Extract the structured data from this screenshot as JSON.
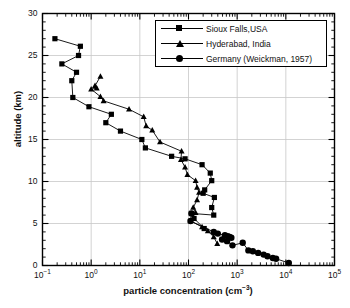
{
  "chart_data": {
    "type": "line",
    "title": "",
    "xlabel": "particle concentration (cm⁻³)",
    "ylabel": "altitude (km)",
    "xscale": "log",
    "yscale": "linear",
    "xlim": [
      0.1,
      100000
    ],
    "ylim": [
      0,
      30
    ],
    "grid": true,
    "legend_position": "top-right",
    "xtick_labels": [
      "10",
      "10",
      "10",
      "10",
      "10",
      "10",
      "10"
    ],
    "xtick_exponents": [
      "-1",
      "0",
      "1",
      "2",
      "3",
      "4",
      "5"
    ],
    "xtick_values": [
      0.1,
      1,
      10,
      100,
      1000,
      10000,
      100000
    ],
    "ytick_labels": [
      "0",
      "5",
      "10",
      "15",
      "20",
      "25",
      "30"
    ],
    "ytick_values": [
      0,
      5,
      10,
      15,
      20,
      25,
      30
    ],
    "series": [
      {
        "name": "Sioux Falls,USA",
        "marker": "square",
        "color": "#000000",
        "points": [
          [
            0.18,
            27.0
          ],
          [
            0.6,
            26.1
          ],
          [
            0.55,
            25.0
          ],
          [
            0.25,
            24.0
          ],
          [
            0.5,
            23.0
          ],
          [
            0.4,
            22.0
          ],
          [
            0.42,
            20.0
          ],
          [
            0.9,
            18.9
          ],
          [
            2.6,
            18.0
          ],
          [
            2.0,
            17.0
          ],
          [
            4.0,
            16.0
          ],
          [
            11.0,
            15.0
          ],
          [
            13.0,
            14.0
          ],
          [
            45.0,
            13.0
          ],
          [
            85.0,
            12.7
          ],
          [
            190.0,
            12.0
          ],
          [
            280.0,
            11.0
          ],
          [
            300.0,
            10.1
          ],
          [
            215.0,
            9.0
          ],
          [
            200.0,
            8.6
          ],
          [
            340.0,
            8.1
          ],
          [
            300.0,
            6.9
          ],
          [
            330.0,
            6.0
          ],
          [
            115.0,
            6.2
          ],
          [
            130.0,
            5.6
          ],
          [
            210.0,
            4.4
          ]
        ]
      },
      {
        "name": "Hyderabad, India",
        "marker": "triangle",
        "color": "#000000",
        "points": [
          [
            1.55,
            22.5
          ],
          [
            1.2,
            21.4
          ],
          [
            1.3,
            21.1
          ],
          [
            1.0,
            21.0
          ],
          [
            1.55,
            20.1
          ],
          [
            1.8,
            19.6
          ],
          [
            6.0,
            18.6
          ],
          [
            12.0,
            17.7
          ],
          [
            13.5,
            16.6
          ],
          [
            18.0,
            16.1
          ],
          [
            26.0,
            14.7
          ],
          [
            72.0,
            13.6
          ],
          [
            70.0,
            12.6
          ],
          [
            85.0,
            11.7
          ],
          [
            95.0,
            10.8
          ],
          [
            140.0,
            10.1
          ],
          [
            150.0,
            9.3
          ],
          [
            165.0,
            8.7
          ],
          [
            150.0,
            7.8
          ],
          [
            125.0,
            6.9
          ],
          [
            140.0,
            6.3
          ],
          [
            110.0,
            5.3
          ],
          [
            190.0,
            4.6
          ],
          [
            250.0,
            4.1
          ],
          [
            330.0,
            3.4
          ],
          [
            390.0,
            2.6
          ]
        ]
      },
      {
        "name": "Germany (Weickman, 1957)",
        "marker": "circle",
        "color": "#000000",
        "points": [
          [
            115.0,
            6.2
          ],
          [
            110.0,
            5.3
          ],
          [
            330.0,
            4.0
          ],
          [
            400.0,
            3.8
          ],
          [
            560.0,
            3.6
          ],
          [
            640.0,
            3.5
          ],
          [
            700.0,
            3.4
          ],
          [
            760.0,
            3.3
          ],
          [
            490.0,
            3.1
          ],
          [
            620.0,
            2.9
          ],
          [
            800.0,
            2.4
          ],
          [
            1300.0,
            2.7
          ],
          [
            1700.0,
            1.8
          ],
          [
            2100.0,
            1.7
          ],
          [
            2700.0,
            1.5
          ],
          [
            3500.0,
            1.3
          ],
          [
            4200.0,
            1.1
          ],
          [
            5400.0,
            0.9
          ],
          [
            6300.0,
            0.8
          ],
          [
            11500.0,
            0.3
          ]
        ]
      }
    ]
  },
  "legend": {
    "items": [
      {
        "label": "Sioux Falls,USA",
        "marker": "square"
      },
      {
        "label": "Hyderabad, India",
        "marker": "triangle"
      },
      {
        "label": "Germany (Weickman, 1957)",
        "marker": "circle"
      }
    ]
  },
  "axes": {
    "x_label": "particle concentration (cm⁻³)",
    "y_label": "altitude (km)"
  }
}
